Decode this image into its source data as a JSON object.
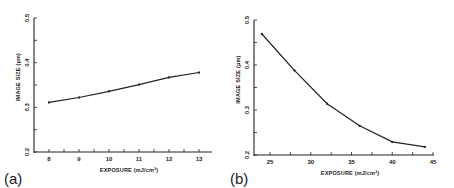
{
  "chart_data": [
    {
      "panel": "(a)",
      "type": "line",
      "title": "",
      "xlabel": "EXPOSURE (mJ/cm²)",
      "ylabel": "IMAGE SIZE (μm)",
      "xlim": [
        7.5,
        13.5
      ],
      "ylim": [
        0.2,
        0.5
      ],
      "x_ticks": [
        8,
        9,
        10,
        11,
        12,
        13
      ],
      "y_ticks": [
        0.2,
        0.3,
        0.4,
        0.5
      ],
      "y_tick_labels": [
        "0.2",
        "0.3",
        "0.4",
        "0.5"
      ],
      "grid": false,
      "legend": null,
      "series": [
        {
          "name": "image size",
          "x": [
            8,
            9,
            10,
            11,
            12,
            13
          ],
          "values": [
            0.311,
            0.322,
            0.336,
            0.351,
            0.367,
            0.378
          ]
        }
      ]
    },
    {
      "panel": "(b)",
      "type": "line",
      "title": "",
      "xlabel": "EXPOSURE (mJ/cm²)",
      "ylabel": "IMAGE SIZE (μm)",
      "xlim": [
        23,
        45
      ],
      "ylim": [
        0.2,
        0.5
      ],
      "x_ticks": [
        25,
        30,
        35,
        40,
        45
      ],
      "y_ticks": [
        0.2,
        0.3,
        0.4,
        0.5
      ],
      "y_tick_labels": [
        "0.2",
        "0.3",
        "0.4",
        "0.5"
      ],
      "grid": false,
      "legend": null,
      "series": [
        {
          "name": "image size",
          "x": [
            24,
            28,
            32,
            36,
            40,
            44
          ],
          "values": [
            0.469,
            0.388,
            0.314,
            0.265,
            0.229,
            0.218
          ]
        }
      ]
    }
  ],
  "labels": {
    "panel_a": "(a)",
    "panel_b": "(b)",
    "xlabel": "EXPOSURE (mJ/cm²)",
    "ylabel": "IMAGE SIZE (μm)"
  }
}
